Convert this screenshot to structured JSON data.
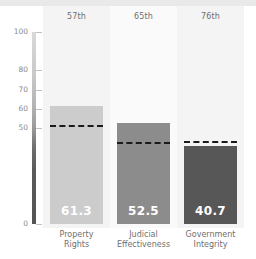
{
  "chart_data": {
    "type": "bar",
    "title": "",
    "xlabel": "",
    "ylabel": "",
    "ylim": [
      0,
      100
    ],
    "grid": false,
    "legend": "none",
    "categories": [
      "Property Rights",
      "Judicial Effectiveness",
      "Government Integrity"
    ],
    "values": [
      61.3,
      52.5,
      40.7
    ],
    "value_labels": [
      "61.3",
      "52.5",
      "40.7"
    ],
    "percentile_labels": [
      "57th",
      "65th",
      "76th"
    ],
    "bar_colors": [
      "#cccccc",
      "#8c8c8c",
      "#575757"
    ],
    "reference_lines": {
      "label": "",
      "style": "dashed",
      "color": "#1a1a1a",
      "values": [
        51.5,
        42.5,
        43.0
      ]
    },
    "yticks": [
      100,
      80,
      70,
      60,
      50,
      0
    ],
    "ytick_labels": [
      "100",
      "80",
      "70",
      "60",
      "50",
      "0"
    ]
  },
  "axis": {
    "tick_color": "#8a8a8a",
    "spine_top_color": "#d9d9d9",
    "spine_bottom_color": "#545454"
  },
  "category_label_lines": [
    [
      "Property",
      "Rights"
    ],
    [
      "Judicial",
      "Effectiveness"
    ],
    [
      "Government",
      "Integrity"
    ]
  ]
}
